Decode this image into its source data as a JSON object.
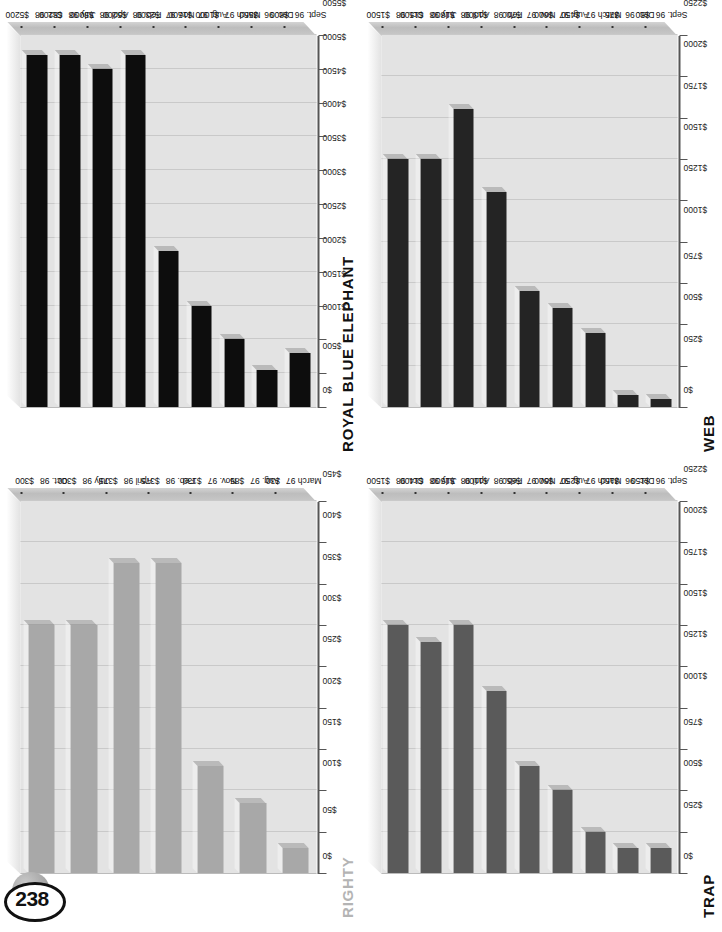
{
  "page": {
    "number": "238"
  },
  "charts": [
    {
      "id": "rbe",
      "title": "ROYAL BLUE ELEPHANT",
      "title_style": "dark",
      "bar_color": "#0d0d0d",
      "chart_data": {
        "type": "bar",
        "title": "ROYAL BLUE ELEPHANT",
        "orientation": "horizontal",
        "xlabel": "",
        "ylabel": "",
        "categories": [
          "Sept. 96",
          "Dec. 96",
          "March 97",
          "Aug. 97",
          "Nov. 97",
          "Feb. 98",
          "April 98",
          "July 98",
          "Oct. 98"
        ],
        "values": [
          800,
          550,
          1000,
          1500,
          2300,
          5200,
          5000,
          5200,
          5200
        ],
        "value_labels": [
          "$800",
          "$550",
          "$1000",
          "$1500",
          "$2300",
          "$5200",
          "$5000",
          "$5200",
          "$5200"
        ],
        "ticks": [
          "$0",
          "$500",
          "$1000",
          "$1500",
          "$2000",
          "$2500",
          "$3000",
          "$3500",
          "$4000",
          "$4500",
          "$5000",
          "$5500"
        ],
        "tick_values": [
          0,
          500,
          1000,
          1500,
          2000,
          2500,
          3000,
          3500,
          4000,
          4500,
          5000,
          5500
        ],
        "ylim": [
          0,
          5500
        ],
        "grid": true,
        "legend": "none"
      }
    },
    {
      "id": "web",
      "title": "WEB",
      "title_style": "dark",
      "bar_color": "#242424",
      "chart_data": {
        "type": "bar",
        "title": "WEB",
        "orientation": "horizontal",
        "xlabel": "",
        "ylabel": "",
        "categories": [
          "Sept. 96",
          "Dec. 96",
          "March 97",
          "Aug. 97",
          "Nov. 97",
          "Feb. 98",
          "April 98",
          "July 98",
          "Oct. 98"
        ],
        "values": [
          50,
          75,
          450,
          600,
          700,
          1300,
          1800,
          1500,
          1500
        ],
        "value_labels": [
          "$50",
          "$75",
          "$450",
          "$600",
          "$700",
          "$1300",
          "$1800",
          "$1500",
          "$1500"
        ],
        "ticks": [
          "$0",
          "$250",
          "$500",
          "$750",
          "$1000",
          "$1250",
          "$1500",
          "$1750",
          "$2000",
          "$2250"
        ],
        "tick_values": [
          0,
          250,
          500,
          750,
          1000,
          1250,
          1500,
          1750,
          2000,
          2250
        ],
        "ylim": [
          0,
          2250
        ],
        "grid": true,
        "legend": "none"
      }
    },
    {
      "id": "righty",
      "title": "RIGHTY",
      "title_style": "light",
      "bar_color": "#a8a8a8",
      "chart_data": {
        "type": "bar",
        "title": "RIGHTY",
        "orientation": "horizontal",
        "xlabel": "",
        "ylabel": "",
        "categories": [
          "March 97",
          "Aug. 97",
          "Nov. 97",
          "Feb. 98",
          "April 98",
          "July 98",
          "Oct. 98"
        ],
        "values": [
          30,
          85,
          130,
          375,
          375,
          300,
          300
        ],
        "value_labels": [
          "$30",
          "$85",
          "$130",
          "$375",
          "$375",
          "$300",
          "$300"
        ],
        "ticks": [
          "$0",
          "$50",
          "$100",
          "$150",
          "$200",
          "$250",
          "$300",
          "$350",
          "$400",
          "$450"
        ],
        "tick_values": [
          0,
          50,
          100,
          150,
          200,
          250,
          300,
          350,
          400,
          450
        ],
        "ylim": [
          0,
          450
        ],
        "grid": true,
        "legend": "none"
      }
    },
    {
      "id": "trap",
      "title": "TRAP",
      "title_style": "dark",
      "bar_color": "#5a5a5a",
      "chart_data": {
        "type": "bar",
        "title": "TRAP",
        "orientation": "horizontal",
        "xlabel": "",
        "ylabel": "",
        "categories": [
          "Sept. 96",
          "Dec. 96",
          "March 97",
          "Aug. 97",
          "Nov. 97",
          "Feb. 98",
          "April 98",
          "July 98",
          "Oct. 98"
        ],
        "values": [
          150,
          150,
          250,
          500,
          650,
          1100,
          1500,
          1400,
          1500
        ],
        "value_labels": [
          "$150",
          "$150",
          "$250",
          "$500",
          "$650",
          "$1100",
          "$1500",
          "$1400",
          "$1500"
        ],
        "ticks": [
          "$0",
          "$250",
          "$500",
          "$750",
          "$1000",
          "$1250",
          "$1500",
          "$1750",
          "$2000",
          "$2250"
        ],
        "tick_values": [
          0,
          250,
          500,
          750,
          1000,
          1250,
          1500,
          1750,
          2000,
          2250
        ],
        "ylim": [
          0,
          2250
        ],
        "grid": true,
        "legend": "none"
      }
    }
  ]
}
